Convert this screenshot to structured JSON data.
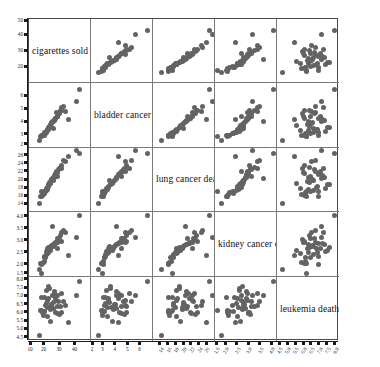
{
  "figure": {
    "type": "scatterplot-matrix",
    "n_variables": 5,
    "point_color": "#636363",
    "frame_color": "#4a4a4a",
    "grid_color": "#7a7a7a",
    "background": "#ffffff"
  },
  "variables": [
    {
      "key": "cigarettes",
      "label": "cigarettes sold per",
      "axis_min": 10,
      "axis_max": 50,
      "yticks": [
        {
          "v": 50,
          "t": "50"
        },
        {
          "v": 40,
          "t": "40"
        },
        {
          "v": 30,
          "t": "30"
        },
        {
          "v": 20,
          "t": "20"
        }
      ],
      "xticks": [
        {
          "v": 10,
          "t": "10"
        },
        {
          "v": 20,
          "t": "20"
        },
        {
          "v": 30,
          "t": "30"
        },
        {
          "v": 40,
          "t": "40"
        }
      ]
    },
    {
      "key": "bladder",
      "label": "bladder cancer death",
      "axis_min": 2,
      "axis_max": 7,
      "yticks": [
        {
          "v": 6,
          "t": "6"
        },
        {
          "v": 5,
          "t": "5"
        },
        {
          "v": 4,
          "t": "4"
        },
        {
          "v": 3,
          "t": "3"
        },
        {
          "v": 2,
          "t": "2"
        }
      ],
      "xticks": [
        {
          "v": 2,
          "t": "2"
        },
        {
          "v": 3,
          "t": "3"
        },
        {
          "v": 4,
          "t": "4"
        },
        {
          "v": 5,
          "t": "5"
        },
        {
          "v": 6,
          "t": "6"
        }
      ]
    },
    {
      "key": "lung",
      "label": "lung cancer deaths",
      "axis_min": 12,
      "axis_max": 28,
      "yticks": [
        {
          "v": 26,
          "t": "26"
        },
        {
          "v": 24,
          "t": "24"
        },
        {
          "v": 22,
          "t": "22"
        },
        {
          "v": 20,
          "t": "20"
        },
        {
          "v": 18,
          "t": "18"
        },
        {
          "v": 16,
          "t": "16"
        },
        {
          "v": 14,
          "t": "14"
        }
      ],
      "xticks": [
        {
          "v": 14,
          "t": "14"
        },
        {
          "v": 16,
          "t": "16"
        },
        {
          "v": 18,
          "t": "18"
        },
        {
          "v": 20,
          "t": "20"
        },
        {
          "v": 22,
          "t": "22"
        },
        {
          "v": 24,
          "t": "24"
        },
        {
          "v": 26,
          "t": "26"
        }
      ]
    },
    {
      "key": "kidney",
      "label": "kidney cancer death",
      "axis_min": 1.5,
      "axis_max": 4.2,
      "yticks": [
        {
          "v": 4.0,
          "t": "4.0"
        },
        {
          "v": 3.5,
          "t": "3.5"
        },
        {
          "v": 3.0,
          "t": "3.0"
        },
        {
          "v": 2.5,
          "t": "2.5"
        },
        {
          "v": 2.0,
          "t": "2.0"
        },
        {
          "v": 1.5,
          "t": "1.5"
        }
      ],
      "xticks": [
        {
          "v": 1.5,
          "t": "1.5"
        },
        {
          "v": 2.0,
          "t": "2.0"
        },
        {
          "v": 2.5,
          "t": "2.5"
        },
        {
          "v": 3.0,
          "t": "3.0"
        },
        {
          "v": 3.5,
          "t": "3.5"
        },
        {
          "v": 4.0,
          "t": "4.0"
        }
      ]
    },
    {
      "key": "leukemia",
      "label": "leukemia deaths per",
      "axis_min": 4.3,
      "axis_max": 8.2,
      "yticks": [
        {
          "v": 8.0,
          "t": "8.0"
        },
        {
          "v": 7.5,
          "t": "7.5"
        },
        {
          "v": 7.0,
          "t": "7.0"
        },
        {
          "v": 6.5,
          "t": "6.5"
        },
        {
          "v": 6.0,
          "t": "6.0"
        },
        {
          "v": 5.5,
          "t": "5.5"
        },
        {
          "v": 5.0,
          "t": "5.0"
        },
        {
          "v": 4.5,
          "t": "4.5"
        }
      ],
      "xticks": [
        {
          "v": 4.5,
          "t": "4.5"
        },
        {
          "v": 5.0,
          "t": "5.0"
        },
        {
          "v": 5.5,
          "t": "5.5"
        },
        {
          "v": 6.0,
          "t": "6.0"
        },
        {
          "v": 6.5,
          "t": "6.5"
        },
        {
          "v": 7.0,
          "t": "7.0"
        },
        {
          "v": 7.5,
          "t": "7.5"
        },
        {
          "v": 8.0,
          "t": "8.0"
        }
      ]
    }
  ],
  "chart_data": {
    "type": "scatter",
    "title": "",
    "layout": "5x5 scatterplot matrix, diagonal shows variable names",
    "xlabel": "",
    "ylabel": "",
    "grid": true,
    "legend": "none",
    "variables": [
      "cigarettes sold per",
      "bladder cancer death",
      "lung cancer deaths",
      "kidney cancer death",
      "leukemia deaths per"
    ],
    "axis_ranges": {
      "cigarettes": [
        10,
        50
      ],
      "bladder": [
        2,
        7
      ],
      "lung": [
        12,
        28
      ],
      "kidney": [
        1.5,
        4.2
      ],
      "leukemia": [
        4.3,
        8.2
      ]
    },
    "n_points": 44,
    "observations": [
      {
        "cigarettes": 18.2,
        "bladder": 2.9,
        "lung": 17.05,
        "kidney": 1.59,
        "leukemia": 6.15
      },
      {
        "cigarettes": 25.82,
        "bladder": 3.52,
        "lung": 19.8,
        "kidney": 2.75,
        "leukemia": 6.61
      },
      {
        "cigarettes": 18.24,
        "bladder": 2.99,
        "lung": 15.98,
        "kidney": 2.02,
        "leukemia": 6.94
      },
      {
        "cigarettes": 28.6,
        "bladder": 4.46,
        "lung": 22.07,
        "kidney": 2.66,
        "leukemia": 7.06
      },
      {
        "cigarettes": 31.1,
        "bladder": 5.11,
        "lung": 22.83,
        "kidney": 3.35,
        "leukemia": 7.2
      },
      {
        "cigarettes": 33.6,
        "bladder": 4.78,
        "lung": 24.55,
        "kidney": 3.36,
        "leukemia": 6.45
      },
      {
        "cigarettes": 40.46,
        "bladder": 5.6,
        "lung": 27.27,
        "kidney": 3.13,
        "leukemia": 7.08
      },
      {
        "cigarettes": 28.27,
        "bladder": 4.46,
        "lung": 20.94,
        "kidney": 3.08,
        "leukemia": 6.41
      },
      {
        "cigarettes": 20.1,
        "bladder": 3.08,
        "lung": 16.59,
        "kidney": 2.31,
        "leukemia": 6.07
      },
      {
        "cigarettes": 27.91,
        "bladder": 4.75,
        "lung": 22.12,
        "kidney": 2.91,
        "leukemia": 6.75
      },
      {
        "cigarettes": 26.18,
        "bladder": 4.09,
        "lung": 20.74,
        "kidney": 2.86,
        "leukemia": 7.27
      },
      {
        "cigarettes": 22.12,
        "bladder": 3.31,
        "lung": 17.71,
        "kidney": 2.52,
        "leukemia": 6.31
      },
      {
        "cigarettes": 21.84,
        "bladder": 3.42,
        "lung": 18.04,
        "kidney": 2.66,
        "leukemia": 6.78
      },
      {
        "cigarettes": 23.44,
        "bladder": 3.62,
        "lung": 19.5,
        "kidney": 2.74,
        "leukemia": 6.35
      },
      {
        "cigarettes": 21.58,
        "bladder": 3.24,
        "lung": 18.0,
        "kidney": 2.55,
        "leukemia": 7.38
      },
      {
        "cigarettes": 28.64,
        "bladder": 4.46,
        "lung": 21.89,
        "kidney": 2.95,
        "leukemia": 5.98
      },
      {
        "cigarettes": 31.1,
        "bladder": 4.9,
        "lung": 23.57,
        "kidney": 2.99,
        "leukemia": 6.02
      },
      {
        "cigarettes": 17.45,
        "bladder": 2.85,
        "lung": 15.92,
        "kidney": 2.06,
        "leukemia": 6.15
      },
      {
        "cigarettes": 22.06,
        "bladder": 3.36,
        "lung": 17.95,
        "kidney": 2.46,
        "leukemia": 5.78
      },
      {
        "cigarettes": 24.71,
        "bladder": 3.97,
        "lung": 20.1,
        "kidney": 2.8,
        "leukemia": 6.52
      },
      {
        "cigarettes": 25.02,
        "bladder": 4.02,
        "lung": 20.45,
        "kidney": 3.62,
        "leukemia": 7.08
      },
      {
        "cigarettes": 20.08,
        "bladder": 2.98,
        "lung": 16.82,
        "kidney": 2.15,
        "leukemia": 6.1
      },
      {
        "cigarettes": 29.18,
        "bladder": 4.63,
        "lung": 22.54,
        "kidney": 3.1,
        "leukemia": 6.67
      },
      {
        "cigarettes": 23.75,
        "bladder": 3.75,
        "lung": 19.16,
        "kidney": 2.61,
        "leukemia": 5.5
      },
      {
        "cigarettes": 26.92,
        "bladder": 4.25,
        "lung": 21.3,
        "kidney": 2.88,
        "leukemia": 6.88
      },
      {
        "cigarettes": 19.96,
        "bladder": 3.15,
        "lung": 17.02,
        "kidney": 2.35,
        "leukemia": 6.94
      },
      {
        "cigarettes": 22.85,
        "bladder": 3.55,
        "lung": 18.76,
        "kidney": 2.7,
        "leukemia": 7.6
      },
      {
        "cigarettes": 30.34,
        "bladder": 4.88,
        "lung": 23.1,
        "kidney": 3.22,
        "leukemia": 6.36
      },
      {
        "cigarettes": 24.1,
        "bladder": 3.82,
        "lung": 19.62,
        "kidney": 2.68,
        "leukemia": 6.2
      },
      {
        "cigarettes": 21.2,
        "bladder": 3.2,
        "lung": 17.4,
        "kidney": 2.43,
        "leukemia": 6.58
      },
      {
        "cigarettes": 27.1,
        "bladder": 4.3,
        "lung": 21.55,
        "kidney": 2.94,
        "leukemia": 6.05
      },
      {
        "cigarettes": 19.1,
        "bladder": 2.95,
        "lung": 16.3,
        "kidney": 2.1,
        "leukemia": 5.85
      },
      {
        "cigarettes": 32.45,
        "bladder": 5.24,
        "lung": 24.9,
        "kidney": 3.45,
        "leukemia": 6.7
      },
      {
        "cigarettes": 23.05,
        "bladder": 3.58,
        "lung": 18.85,
        "kidney": 2.58,
        "leukemia": 7.45
      },
      {
        "cigarettes": 25.6,
        "bladder": 4.05,
        "lung": 20.6,
        "kidney": 2.84,
        "leukemia": 6.28
      },
      {
        "cigarettes": 20.75,
        "bladder": 3.12,
        "lung": 17.2,
        "kidney": 2.28,
        "leukemia": 6.42
      },
      {
        "cigarettes": 29.8,
        "bladder": 4.7,
        "lung": 22.95,
        "kidney": 3.05,
        "leukemia": 5.92
      },
      {
        "cigarettes": 22.5,
        "bladder": 3.45,
        "lung": 18.4,
        "kidney": 2.5,
        "leukemia": 6.86
      },
      {
        "cigarettes": 26.45,
        "bladder": 4.18,
        "lung": 21.05,
        "kidney": 2.9,
        "leukemia": 7.15
      },
      {
        "cigarettes": 18.95,
        "bladder": 2.92,
        "lung": 16.1,
        "kidney": 2.04,
        "leukemia": 6.0
      },
      {
        "cigarettes": 24.35,
        "bladder": 3.88,
        "lung": 19.85,
        "kidney": 2.76,
        "leukemia": 6.48
      },
      {
        "cigarettes": 35.2,
        "bladder": 4.2,
        "lung": 25.8,
        "kidney": 2.4,
        "leukemia": 5.4
      },
      {
        "cigarettes": 42.8,
        "bladder": 6.54,
        "lung": 26.48,
        "kidney": 4.05,
        "leukemia": 7.92
      },
      {
        "cigarettes": 16.8,
        "bladder": 2.6,
        "lung": 14.2,
        "kidney": 1.8,
        "leukemia": 4.62
      }
    ]
  }
}
